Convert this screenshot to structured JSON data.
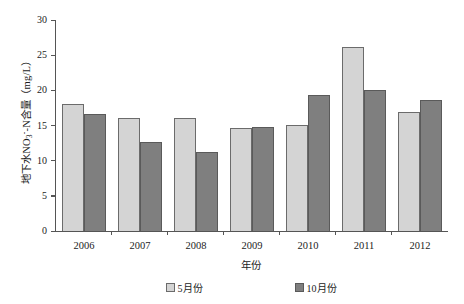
{
  "chart_data": {
    "type": "bar",
    "title": "",
    "categories": [
      "2006",
      "2007",
      "2008",
      "2009",
      "2010",
      "2011",
      "2012"
    ],
    "series": [
      {
        "name": "5月份",
        "color": "#d4d4d4",
        "values": [
          18.1,
          16.0,
          16.0,
          14.7,
          15.1,
          26.2,
          16.9
        ]
      },
      {
        "name": "10月份",
        "color": "#7f7f7f",
        "values": [
          16.7,
          12.7,
          11.3,
          14.8,
          19.3,
          20.1,
          18.6
        ]
      }
    ],
    "xlabel": "年份",
    "ylabel": "地下水NO3--N含量（mg/L）",
    "ylim": [
      0,
      30
    ],
    "yticks": [
      30,
      25,
      20,
      15,
      10,
      5,
      0
    ],
    "ytick_labels": [
      "30",
      "25",
      "20",
      "15",
      "10",
      "5",
      "0"
    ],
    "grid": false,
    "legend_position": "bottom"
  },
  "axes": {
    "y_title_main": "地下水NO",
    "y_title_sub": "3",
    "y_title_sup": "-",
    "y_title_tail": "-N含量（mg/L）",
    "x_title": "年份"
  },
  "legend": {
    "items": [
      {
        "label": "5月份"
      },
      {
        "label": "10月份"
      }
    ]
  }
}
